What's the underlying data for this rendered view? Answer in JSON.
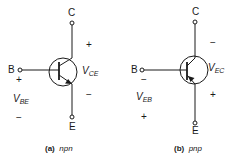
{
  "figure": {
    "npn": {
      "caption_tag": "(a)",
      "caption_type": "npn",
      "terminals": {
        "collector": "C",
        "base": "B",
        "emitter": "E"
      },
      "vce": {
        "main": "V",
        "sub": "CE"
      },
      "vbe": {
        "main": "V",
        "sub": "BE"
      },
      "polarity": {
        "ce_top": "+",
        "ce_bottom": "−",
        "be_top": "+",
        "be_bottom": "−"
      }
    },
    "pnp": {
      "caption_tag": "(b)",
      "caption_type": "pnp",
      "terminals": {
        "collector": "C",
        "base": "B",
        "emitter": "E"
      },
      "vec": {
        "main": "V",
        "sub": "EC"
      },
      "veb": {
        "main": "V",
        "sub": "EB"
      },
      "polarity": {
        "ec_top": "−",
        "ec_bottom": "+",
        "eb_top": "−",
        "eb_bottom": "+"
      }
    }
  }
}
